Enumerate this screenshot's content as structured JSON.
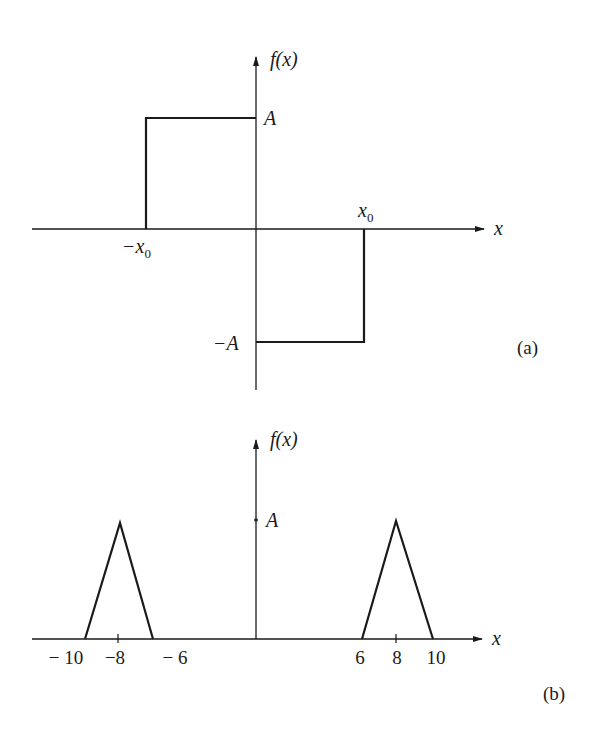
{
  "panels": [
    {
      "id": "a",
      "caption": "(a)",
      "y_axis_label": "f(x)",
      "x_axis_label": "x",
      "description": "Odd rectangular pulse: f(x)=A for -x0<x<0, f(x)=-A for 0<x<x0",
      "level_labels": {
        "positive": "A",
        "negative": "−A"
      },
      "x_tick_labels": {
        "left": "−x",
        "left_sub": "0",
        "right": "x",
        "right_sub": "0"
      },
      "segments": [
        {
          "x_from": "-x0",
          "x_to": "0",
          "value": "A"
        },
        {
          "x_from": "0",
          "x_to": "x0",
          "value": "-A"
        }
      ]
    },
    {
      "id": "b",
      "caption": "(b)",
      "y_axis_label": "f(x)",
      "x_axis_label": "x",
      "description": "Two triangular pulses of height A centered at x=-8 and x=8, each with base width 4",
      "level_label": "A",
      "x_tick_labels": [
        "− 10",
        "−8",
        "− 6",
        "6",
        "8",
        "10"
      ],
      "triangles": [
        {
          "start": -10,
          "peak": -8,
          "end": -6,
          "height": "A"
        },
        {
          "start": 6,
          "peak": 8,
          "end": 10,
          "height": "A"
        }
      ]
    }
  ],
  "colors": {
    "ink": "#1a1a1a",
    "background": "#ffffff"
  }
}
